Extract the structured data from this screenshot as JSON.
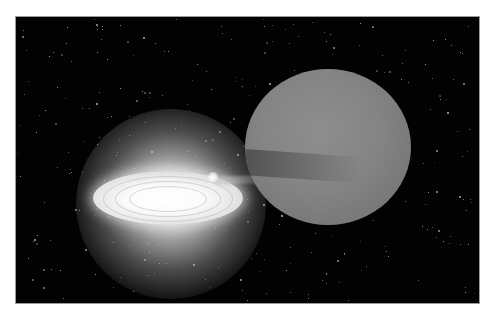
{
  "image": {
    "subject": "Binary star system illustration: accretion disk around a compact star drawing matter from a large companion star",
    "palette": {
      "background_page": "#ffffff",
      "space": "#020202",
      "frame_border": "#9a9a9a",
      "disk_core": "#ffffff",
      "companion_star": "#858585",
      "stream_band": "#5a5a5a"
    },
    "elements": [
      {
        "name": "starfield",
        "description": "black space with scattered faint white stars"
      },
      {
        "name": "accretion-disk",
        "description": "bright white elliptical disk with concentric rings, surrounded by a glowing halo"
      },
      {
        "name": "hotspot",
        "description": "small bright spot on disk rim where stream impacts"
      },
      {
        "name": "mass-transfer-stream",
        "description": "faint stream of gas from companion toward disk"
      },
      {
        "name": "companion-star",
        "description": "large gray mottled sphere with a dark band on its left side"
      }
    ]
  }
}
